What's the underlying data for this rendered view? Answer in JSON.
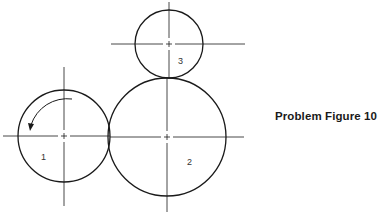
{
  "caption": "Problem Figure 10",
  "gears": [
    {
      "label": "1",
      "cx": 64,
      "cy": 136,
      "r": 46,
      "rotation": "counterclockwise"
    },
    {
      "label": "2",
      "cx": 167,
      "cy": 137,
      "r": 59
    },
    {
      "label": "3",
      "cx": 169,
      "cy": 44,
      "r": 34
    }
  ],
  "colors": {
    "stroke": "#1a1a1a",
    "background": "#ffffff"
  }
}
